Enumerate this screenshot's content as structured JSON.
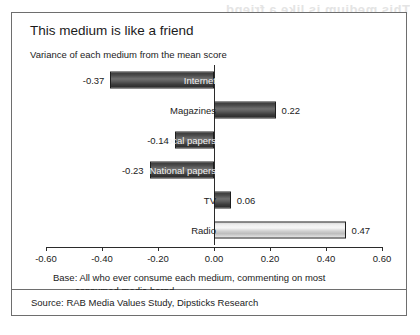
{
  "figure": {
    "title": "This medium is like a friend",
    "subtitle": "Variance of each medium from the mean score",
    "base_line1": "Base: All who ever consume each medium, commenting on most",
    "base_line2": "consumed media barnd",
    "source": "Source: RAB Media Values Study, Dipsticks Research",
    "bleed_artifact": "This medium is like a friend"
  },
  "chart_data": {
    "type": "bar",
    "orientation": "horizontal",
    "title": "This medium is like a friend",
    "subtitle": "Variance of each medium from the mean score",
    "xlabel": "",
    "ylabel": "",
    "xlim": [
      -0.6,
      0.6
    ],
    "grid": false,
    "legend": "none",
    "tick_labels": [
      "-0.60",
      "-0.40",
      "-0.20",
      "0.00",
      "0.20",
      "0.40",
      "0.60"
    ],
    "tick_values": [
      -0.6,
      -0.4,
      -0.2,
      0.0,
      0.2,
      0.4,
      0.6
    ],
    "categories": [
      "Internet",
      "Magazines",
      "Local papers",
      "National papers",
      "TV",
      "Radio"
    ],
    "values": [
      -0.37,
      0.22,
      -0.14,
      -0.23,
      0.06,
      0.47
    ],
    "value_labels": [
      "-0.37",
      "0.22",
      "-0.14",
      "-0.23",
      "0.06",
      "0.47"
    ],
    "bars": [
      {
        "category": "Internet",
        "value": -0.37,
        "label": "-0.37",
        "style": "dark",
        "label_on_bar": true
      },
      {
        "category": "Magazines",
        "value": 0.22,
        "label": "0.22",
        "style": "dark",
        "label_on_bar": false
      },
      {
        "category": "Local papers",
        "value": -0.14,
        "label": "-0.14",
        "style": "dark",
        "label_on_bar": true
      },
      {
        "category": "National papers",
        "value": -0.23,
        "label": "-0.23",
        "style": "dark",
        "label_on_bar": true
      },
      {
        "category": "TV",
        "value": 0.06,
        "label": "0.06",
        "style": "dark",
        "label_on_bar": false
      },
      {
        "category": "Radio",
        "value": 0.47,
        "label": "0.47",
        "style": "light",
        "label_on_bar": false
      }
    ],
    "colors": {
      "bar_dark": "#4a4a4a",
      "bar_light": "#e6e6e6",
      "bar_outline": "#1d1d1d",
      "axis": "#2b2b2b",
      "text": "#1b1b1b",
      "frame": "#6e6e6e"
    }
  }
}
